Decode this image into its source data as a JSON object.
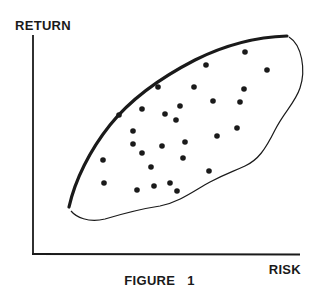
{
  "figure": {
    "caption": "FIGURE 1",
    "ylabel": "RETURN",
    "xlabel": "RISK"
  },
  "colors": {
    "ink": "#1a1a1a",
    "background": "#ffffff"
  },
  "chart_data": {
    "type": "scatter",
    "title": "FIGURE 1",
    "xlabel": "RISK",
    "ylabel": "RETURN",
    "xlim": [
      0,
      100
    ],
    "ylim": [
      0,
      100
    ],
    "grid": false,
    "legend": null,
    "ticks": "none",
    "annotations": [
      "Thick curve along upper-left boundary = efficient frontier",
      "Thin closed outline encloses the feasible set of portfolios"
    ],
    "points_pixel_coords": [
      [
        245,
        52
      ],
      [
        206,
        65
      ],
      [
        267,
        70
      ],
      [
        158,
        87
      ],
      [
        194,
        87
      ],
      [
        244,
        89
      ],
      [
        213,
        101
      ],
      [
        240,
        102
      ],
      [
        142,
        109
      ],
      [
        180,
        106
      ],
      [
        119,
        115
      ],
      [
        165,
        114
      ],
      [
        176,
        120
      ],
      [
        237,
        128
      ],
      [
        217,
        136
      ],
      [
        133,
        131
      ],
      [
        133,
        144
      ],
      [
        162,
        146
      ],
      [
        185,
        142
      ],
      [
        142,
        153
      ],
      [
        103,
        160
      ],
      [
        183,
        158
      ],
      [
        151,
        167
      ],
      [
        209,
        171
      ],
      [
        104,
        183
      ],
      [
        154,
        186
      ],
      [
        170,
        183
      ],
      [
        137,
        190
      ],
      [
        177,
        191
      ]
    ],
    "series": [
      {
        "name": "portfolios",
        "points": [
          {
            "x": 80,
            "y": 92
          },
          {
            "x": 65,
            "y": 86
          },
          {
            "x": 88,
            "y": 84
          },
          {
            "x": 47,
            "y": 77
          },
          {
            "x": 60,
            "y": 77
          },
          {
            "x": 79,
            "y": 75
          },
          {
            "x": 67,
            "y": 70
          },
          {
            "x": 77,
            "y": 69
          },
          {
            "x": 41,
            "y": 67
          },
          {
            "x": 55,
            "y": 68
          },
          {
            "x": 32,
            "y": 64
          },
          {
            "x": 49,
            "y": 65
          },
          {
            "x": 53,
            "y": 62
          },
          {
            "x": 76,
            "y": 58
          },
          {
            "x": 68,
            "y": 54
          },
          {
            "x": 37,
            "y": 56
          },
          {
            "x": 37,
            "y": 50
          },
          {
            "x": 48,
            "y": 49
          },
          {
            "x": 56,
            "y": 51
          },
          {
            "x": 41,
            "y": 46
          },
          {
            "x": 26,
            "y": 43
          },
          {
            "x": 55,
            "y": 44
          },
          {
            "x": 44,
            "y": 40
          },
          {
            "x": 66,
            "y": 38
          },
          {
            "x": 26,
            "y": 33
          },
          {
            "x": 45,
            "y": 31
          },
          {
            "x": 51,
            "y": 33
          },
          {
            "x": 39,
            "y": 29
          },
          {
            "x": 54,
            "y": 29
          }
        ]
      }
    ],
    "frontier": {
      "name": "efficient frontier",
      "points": [
        {
          "x": 13,
          "y": 22
        },
        {
          "x": 23,
          "y": 52
        },
        {
          "x": 33,
          "y": 66
        },
        {
          "x": 47,
          "y": 79
        },
        {
          "x": 62,
          "y": 89
        },
        {
          "x": 81,
          "y": 97
        },
        {
          "x": 95,
          "y": 99
        }
      ]
    }
  }
}
